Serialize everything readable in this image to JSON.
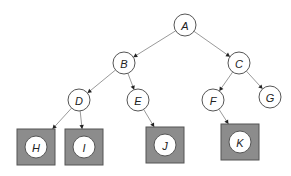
{
  "diagram": {
    "type": "tree",
    "colors": {
      "observed_fill": "#8c8c8c",
      "node_fill": "#ffffff",
      "edge": "#9a9a9a"
    },
    "nodes": [
      {
        "id": "A",
        "label": "A",
        "observed": false
      },
      {
        "id": "B",
        "label": "B",
        "observed": false
      },
      {
        "id": "C",
        "label": "C",
        "observed": false
      },
      {
        "id": "D",
        "label": "D",
        "observed": false
      },
      {
        "id": "E",
        "label": "E",
        "observed": false
      },
      {
        "id": "F",
        "label": "F",
        "observed": false
      },
      {
        "id": "G",
        "label": "G",
        "observed": false
      },
      {
        "id": "H",
        "label": "H",
        "observed": true
      },
      {
        "id": "I",
        "label": "I",
        "observed": true
      },
      {
        "id": "J",
        "label": "J",
        "observed": true
      },
      {
        "id": "K",
        "label": "K",
        "observed": true
      }
    ],
    "edges": [
      [
        "A",
        "B"
      ],
      [
        "A",
        "C"
      ],
      [
        "B",
        "D"
      ],
      [
        "B",
        "E"
      ],
      [
        "C",
        "F"
      ],
      [
        "C",
        "G"
      ],
      [
        "D",
        "H"
      ],
      [
        "D",
        "I"
      ],
      [
        "E",
        "J"
      ],
      [
        "F",
        "K"
      ]
    ]
  }
}
